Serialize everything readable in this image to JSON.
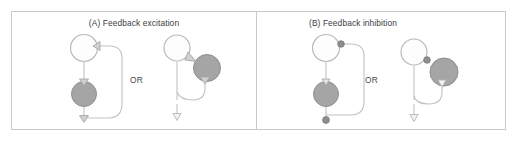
{
  "figure": {
    "background_color": "#ffffff",
    "border_color": "#c9c9c9",
    "or_label": "OR"
  },
  "style_tokens": {
    "white_neuron_fill": "#fdfdfd",
    "white_neuron_stroke": "#b9b9b9",
    "gray_neuron_fill": "#a5a5a5",
    "gray_neuron_stroke": "#8f8f8f",
    "wire_color": "#c2c2c2",
    "excitatory_terminal_fill": "#d0d0d0",
    "excitatory_terminal_stroke": "#a8a8a8",
    "inhibitory_terminal_fill": "#8e8e8e",
    "inhibitory_terminal_stroke": "#7a7a7a",
    "text_color": "#3c3c3c"
  },
  "panels": [
    {
      "id": "A",
      "title": "(A) Feedback excitation",
      "or_label": "OR",
      "circuits": [
        {
          "name": "circuit-a1",
          "layout": "vertical-loop",
          "neurons": [
            {
              "role": "principal-neuron",
              "type": "white",
              "position": "top"
            },
            {
              "role": "interneuron",
              "type": "gray",
              "position": "middle"
            }
          ],
          "terminals": [
            {
              "role": "feedback-onto-principal",
              "kind": "excitatory",
              "glyph": "triangle"
            },
            {
              "role": "principal-onto-interneuron",
              "kind": "excitatory",
              "glyph": "triangle"
            },
            {
              "role": "output-axon",
              "kind": "excitatory",
              "glyph": "triangle"
            }
          ]
        },
        {
          "name": "circuit-a2",
          "layout": "lateral-loop",
          "neurons": [
            {
              "role": "principal-neuron",
              "type": "white",
              "position": "top-left"
            },
            {
              "role": "interneuron",
              "type": "gray",
              "position": "right"
            }
          ],
          "terminals": [
            {
              "role": "feedback-onto-principal",
              "kind": "excitatory",
              "glyph": "triangle"
            },
            {
              "role": "principal-onto-interneuron",
              "kind": "excitatory",
              "glyph": "triangle"
            },
            {
              "role": "output-axon",
              "kind": "excitatory",
              "glyph": "triangle"
            }
          ]
        }
      ]
    },
    {
      "id": "B",
      "title": "(B) Feedback inhibition",
      "or_label": "OR",
      "circuits": [
        {
          "name": "circuit-b1",
          "layout": "vertical-loop",
          "neurons": [
            {
              "role": "principal-neuron",
              "type": "white",
              "position": "top"
            },
            {
              "role": "interneuron",
              "type": "gray",
              "position": "middle"
            }
          ],
          "terminals": [
            {
              "role": "feedback-onto-principal",
              "kind": "inhibitory",
              "glyph": "filled-circle"
            },
            {
              "role": "principal-onto-interneuron",
              "kind": "excitatory",
              "glyph": "triangle"
            },
            {
              "role": "output-axon",
              "kind": "inhibitory",
              "glyph": "filled-circle"
            }
          ]
        },
        {
          "name": "circuit-b2",
          "layout": "lateral-loop",
          "neurons": [
            {
              "role": "principal-neuron",
              "type": "white",
              "position": "top-left"
            },
            {
              "role": "interneuron",
              "type": "gray",
              "position": "right"
            }
          ],
          "terminals": [
            {
              "role": "feedback-onto-principal",
              "kind": "inhibitory",
              "glyph": "filled-circle"
            },
            {
              "role": "principal-onto-interneuron",
              "kind": "excitatory",
              "glyph": "triangle"
            },
            {
              "role": "output-axon",
              "kind": "excitatory",
              "glyph": "triangle"
            }
          ]
        }
      ]
    }
  ]
}
